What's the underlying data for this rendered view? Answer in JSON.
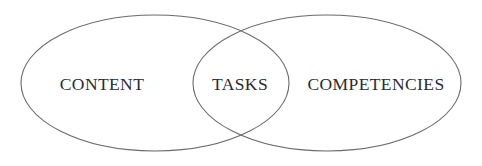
{
  "diagram": {
    "type": "venn-diagram",
    "title": "",
    "background_color": "#ffffff",
    "stroke_color": "#6a6a70",
    "text_color": "#2b2b30",
    "sets": [
      {
        "id": "content",
        "label": "CONTENT",
        "shape": "ellipse",
        "center_x": 155,
        "center_y": 83,
        "radius_x": 134,
        "radius_y": 68,
        "label_x": 102,
        "label_y": 85
      },
      {
        "id": "competencies",
        "label": "COMPETENCIES",
        "shape": "ellipse",
        "center_x": 327,
        "center_y": 83,
        "radius_x": 134,
        "radius_y": 68,
        "label_x": 376,
        "label_y": 85
      }
    ],
    "intersection": {
      "id": "tasks",
      "label": "TASKS",
      "label_x": 240,
      "label_y": 85
    }
  }
}
